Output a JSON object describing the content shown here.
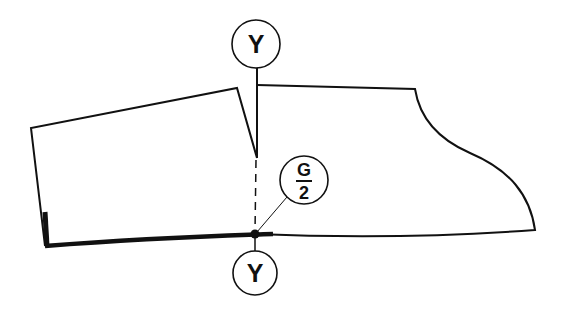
{
  "diagram": {
    "type": "pattern-drafting",
    "colors": {
      "line": "#111111",
      "background": "#ffffff"
    },
    "labels": {
      "top_marker": "Y",
      "bottom_marker": "Y",
      "fraction_numerator": "G",
      "fraction_denominator": "2"
    }
  }
}
